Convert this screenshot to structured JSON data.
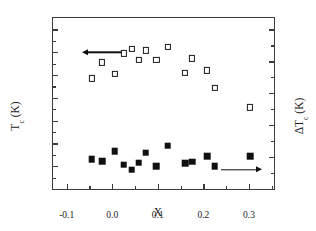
{
  "chart_data": {
    "type": "scatter",
    "title": "",
    "xlabel": "X",
    "ylabel": "T_c (K)",
    "ylabel_right": "ΔT_c (K)",
    "xlim": [
      -0.13,
      0.355
    ],
    "ylim": [
      80,
      95
    ],
    "ylim_right": [
      0,
      10.714
    ],
    "grid": false,
    "legend_position": "inline-arrows",
    "xticks": [
      -0.1,
      0.0,
      0.1,
      0.2,
      0.3
    ],
    "xticklabels": [
      "-0.1",
      "0.0",
      "0.1",
      "0.2",
      "0.3"
    ],
    "xminorticks": [
      -0.05,
      0.05,
      0.15,
      0.25,
      0.35
    ],
    "yticks": [
      80,
      82,
      84,
      86,
      88,
      90,
      92,
      94
    ],
    "yticklabels": [
      "80",
      "82",
      "84",
      "86",
      "88",
      "90",
      "92",
      "94"
    ],
    "yminorticks": [
      81,
      83,
      85,
      87,
      89,
      91,
      93
    ],
    "yticks_right": [
      0,
      2,
      4,
      6,
      8,
      10
    ],
    "yticklabels_right": [
      "0",
      "2",
      "4",
      "6",
      "8",
      "10"
    ],
    "yminorticks_right": [
      1,
      3,
      5,
      7,
      9
    ],
    "series": [
      {
        "name": "T_c (K)",
        "marker": "open-square",
        "axis": "left",
        "points": [
          {
            "x": -0.045,
            "y": 89.7
          },
          {
            "x": -0.022,
            "y": 91.1
          },
          {
            "x": 0.005,
            "y": 90.1
          },
          {
            "x": 0.025,
            "y": 91.9
          },
          {
            "x": 0.043,
            "y": 92.3
          },
          {
            "x": 0.058,
            "y": 91.3
          },
          {
            "x": 0.073,
            "y": 92.15
          },
          {
            "x": 0.097,
            "y": 91.35
          },
          {
            "x": 0.122,
            "y": 92.45
          },
          {
            "x": 0.16,
            "y": 90.15
          },
          {
            "x": 0.175,
            "y": 91.45
          },
          {
            "x": 0.208,
            "y": 90.4
          },
          {
            "x": 0.225,
            "y": 88.85
          },
          {
            "x": 0.303,
            "y": 87.15
          }
        ]
      },
      {
        "name": "ΔT_c (K)",
        "marker": "filled-square",
        "axis": "right",
        "points": [
          {
            "x": -0.045,
            "y": 1.86
          },
          {
            "x": -0.022,
            "y": 1.75
          },
          {
            "x": 0.005,
            "y": 2.38
          },
          {
            "x": 0.025,
            "y": 1.52
          },
          {
            "x": 0.043,
            "y": 1.21
          },
          {
            "x": 0.058,
            "y": 1.64
          },
          {
            "x": 0.073,
            "y": 2.28
          },
          {
            "x": 0.097,
            "y": 1.43
          },
          {
            "x": 0.122,
            "y": 2.71
          },
          {
            "x": 0.16,
            "y": 1.6
          },
          {
            "x": 0.175,
            "y": 1.72
          },
          {
            "x": 0.208,
            "y": 2.05
          },
          {
            "x": 0.225,
            "y": 1.43
          },
          {
            "x": 0.303,
            "y": 2.07
          }
        ]
      }
    ],
    "annotations": [
      {
        "id": "left-arrow",
        "direction": "left",
        "x_start": 0.02,
        "x_end": -0.055,
        "y": 92.0,
        "axis": "left",
        "meaning": "open squares read on left axis"
      },
      {
        "id": "right-arrow",
        "direction": "right",
        "x_start": 0.238,
        "x_end": 0.318,
        "y": 1.22,
        "axis": "right",
        "meaning": "filled squares read on right axis"
      }
    ]
  },
  "axis_titles": {
    "left_main": "T",
    "left_sub": "c",
    "left_unit": " (K)",
    "right_main": "ΔT",
    "right_sub": "c",
    "right_unit": " (K)",
    "x": "X"
  }
}
